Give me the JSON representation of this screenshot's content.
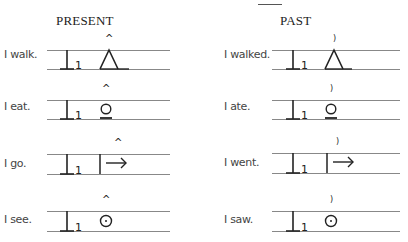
{
  "headers": {
    "present": "PRESENT",
    "past": "PAST"
  },
  "markers": {
    "present": "^",
    "past": ")"
  },
  "subject_symbol": {
    "glyph": "I-stem",
    "subscript": "1"
  },
  "rows": [
    {
      "verb": "walk",
      "present_label": "I walk.",
      "past_label": "I walked.",
      "symbol": "triangle-icon"
    },
    {
      "verb": "eat",
      "present_label": "I eat.",
      "past_label": "I ate.",
      "symbol": "circle-underline-icon"
    },
    {
      "verb": "go",
      "present_label": "I go.",
      "past_label": "I went.",
      "symbol": "bar-arrow-icon"
    },
    {
      "verb": "see",
      "present_label": "I see.",
      "past_label": "I saw.",
      "symbol": "circle-dot-icon"
    }
  ],
  "colors": {
    "ink": "#222222",
    "guide_line": "#888888",
    "label_text": "#444444",
    "background": "#ffffff"
  }
}
